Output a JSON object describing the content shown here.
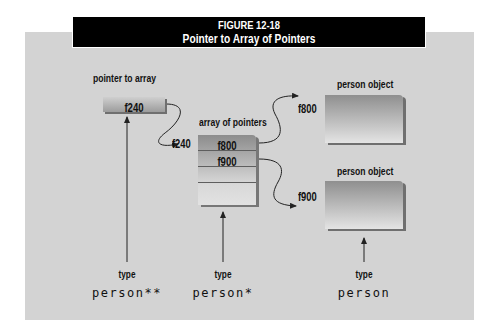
{
  "figure": {
    "number": "FIGURE 12-18",
    "title": "Pointer to Array of Pointers"
  },
  "pointer": {
    "caption": "pointer to array",
    "value": "f240",
    "target_address": "f240",
    "type_label": "type",
    "type": "person**"
  },
  "array": {
    "caption": "array of pointers",
    "rows": [
      "f800",
      "f900",
      "",
      ""
    ],
    "type_label": "type",
    "type": "person*"
  },
  "objects": [
    {
      "caption": "person object",
      "address": "f800"
    },
    {
      "caption": "person object",
      "address": "f900"
    }
  ],
  "object_type": {
    "type_label": "type",
    "type": "person"
  },
  "colors": {
    "panel": "#d3d3d3",
    "titlebar": "#000000",
    "title_text": "#ffffff"
  }
}
